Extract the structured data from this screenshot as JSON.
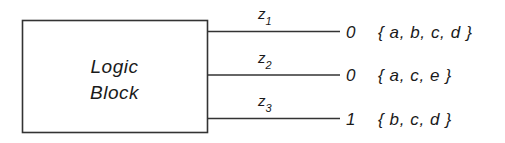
{
  "diagram": {
    "block": {
      "label_line1": "Logic",
      "label_line2": "Block"
    },
    "outputs": [
      {
        "signal": "z",
        "subscript": "1",
        "value": "0",
        "set": "{ a, b, c, d }"
      },
      {
        "signal": "z",
        "subscript": "2",
        "value": "0",
        "set": "{ a, c, e }"
      },
      {
        "signal": "z",
        "subscript": "3",
        "value": "1",
        "set": "{ b, c, d }"
      }
    ],
    "colors": {
      "background": "#ffffff",
      "ink": "#1a1a1a",
      "line": "#333333"
    }
  }
}
